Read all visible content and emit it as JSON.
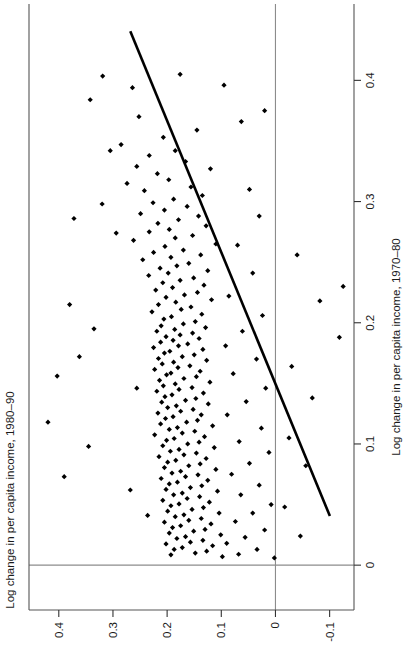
{
  "figure": {
    "background_color": "#ffffff",
    "orientation": "rotated-90-ccw",
    "marker_color": "#000000",
    "fit_line_color": "#000000",
    "reference_line_color": "#8c8c8c",
    "frame_color": "#555555"
  },
  "chart_data": {
    "type": "scatter",
    "title": "",
    "xlabel": "Log change in per capita income, 1970–80",
    "ylabel": "Log change in per capita income, 1980–90",
    "xlim": [
      -0.037,
      0.463
    ],
    "ylim": [
      -0.145,
      0.455
    ],
    "xticks": [
      0,
      0.1,
      0.2,
      0.3,
      0.4
    ],
    "xticklabels": [
      "0",
      "0.1",
      "0.2",
      "0.3",
      "0.4"
    ],
    "yticks": [
      -0.1,
      0,
      0.1,
      0.2,
      0.3,
      0.4
    ],
    "yticklabels": [
      "-0.1",
      "0",
      "0.1",
      "0.2",
      "0.3",
      "0.4"
    ],
    "grid": false,
    "legend": null,
    "reference_lines": [
      {
        "axis": "x",
        "value": 0
      },
      {
        "axis": "y",
        "value": 0
      }
    ],
    "fit_line": {
      "kind": "linear-regression",
      "x_start": 0.0405,
      "y_start": -0.1005,
      "x_end": 0.4405,
      "y_end": 0.268
    },
    "n_points": 251,
    "points": [
      [
        0.4035,
        0.319
      ],
      [
        0.394,
        0.264
      ],
      [
        0.37,
        0.252
      ],
      [
        0.359,
        0.145
      ],
      [
        0.353,
        0.207
      ],
      [
        0.347,
        0.285
      ],
      [
        0.342,
        0.185
      ],
      [
        0.338,
        0.233
      ],
      [
        0.333,
        0.166
      ],
      [
        0.329,
        0.256
      ],
      [
        0.327,
        0.12
      ],
      [
        0.323,
        0.218
      ],
      [
        0.318,
        0.197
      ],
      [
        0.315,
        0.274
      ],
      [
        0.312,
        0.156
      ],
      [
        0.309,
        0.242
      ],
      [
        0.305,
        0.135
      ],
      [
        0.302,
        0.188
      ],
      [
        0.299,
        0.226
      ],
      [
        0.296,
        0.163
      ],
      [
        0.293,
        0.205
      ],
      [
        0.29,
        0.249
      ],
      [
        0.288,
        0.142
      ],
      [
        0.285,
        0.179
      ],
      [
        0.282,
        0.217
      ],
      [
        0.28,
        0.128
      ],
      [
        0.277,
        0.196
      ],
      [
        0.275,
        0.233
      ],
      [
        0.272,
        0.153
      ],
      [
        0.27,
        0.185
      ],
      [
        0.268,
        0.262
      ],
      [
        0.265,
        0.11
      ],
      [
        0.263,
        0.204
      ],
      [
        0.26,
        0.17
      ],
      [
        0.258,
        0.225
      ],
      [
        0.256,
        0.138
      ],
      [
        0.254,
        0.193
      ],
      [
        0.252,
        0.245
      ],
      [
        0.249,
        0.16
      ],
      [
        0.247,
        0.182
      ],
      [
        0.245,
        0.213
      ],
      [
        0.243,
        0.125
      ],
      [
        0.241,
        0.198
      ],
      [
        0.239,
        0.234
      ],
      [
        0.237,
        0.151
      ],
      [
        0.235,
        0.176
      ],
      [
        0.233,
        0.208
      ],
      [
        0.231,
        0.132
      ],
      [
        0.229,
        0.19
      ],
      [
        0.227,
        0.221
      ],
      [
        0.225,
        0.144
      ],
      [
        0.223,
        0.168
      ],
      [
        0.221,
        0.202
      ],
      [
        0.219,
        0.118
      ],
      [
        0.217,
        0.184
      ],
      [
        0.215,
        0.216
      ],
      [
        0.213,
        0.156
      ],
      [
        0.211,
        0.174
      ],
      [
        0.209,
        0.228
      ],
      [
        0.207,
        0.136
      ],
      [
        0.205,
        0.192
      ],
      [
        0.203,
        0.206
      ],
      [
        0.201,
        0.148
      ],
      [
        0.199,
        0.17
      ],
      [
        0.1975,
        0.211
      ],
      [
        0.196,
        0.129
      ],
      [
        0.1945,
        0.186
      ],
      [
        0.193,
        0.219
      ],
      [
        0.1915,
        0.153
      ],
      [
        0.19,
        0.176
      ],
      [
        0.1885,
        0.202
      ],
      [
        0.187,
        0.141
      ],
      [
        0.1855,
        0.189
      ],
      [
        0.184,
        0.212
      ],
      [
        0.1825,
        0.162
      ],
      [
        0.181,
        0.179
      ],
      [
        0.1795,
        0.225
      ],
      [
        0.178,
        0.134
      ],
      [
        0.1765,
        0.195
      ],
      [
        0.175,
        0.205
      ],
      [
        0.1735,
        0.15
      ],
      [
        0.172,
        0.172
      ],
      [
        0.1705,
        0.216
      ],
      [
        0.169,
        0.127
      ],
      [
        0.1675,
        0.188
      ],
      [
        0.166,
        0.209
      ],
      [
        0.1645,
        0.158
      ],
      [
        0.163,
        0.18
      ],
      [
        0.1615,
        0.223
      ],
      [
        0.16,
        0.139
      ],
      [
        0.1585,
        0.193
      ],
      [
        0.157,
        0.201
      ],
      [
        0.1555,
        0.146
      ],
      [
        0.154,
        0.169
      ],
      [
        0.1525,
        0.214
      ],
      [
        0.151,
        0.121
      ],
      [
        0.1495,
        0.185
      ],
      [
        0.148,
        0.207
      ],
      [
        0.1465,
        0.154
      ],
      [
        0.145,
        0.178
      ],
      [
        0.1435,
        0.219
      ],
      [
        0.142,
        0.133
      ],
      [
        0.1405,
        0.191
      ],
      [
        0.139,
        0.204
      ],
      [
        0.1375,
        0.147
      ],
      [
        0.136,
        0.166
      ],
      [
        0.1345,
        0.21
      ],
      [
        0.133,
        0.124
      ],
      [
        0.1315,
        0.183
      ],
      [
        0.13,
        0.199
      ],
      [
        0.1285,
        0.152
      ],
      [
        0.127,
        0.175
      ],
      [
        0.1255,
        0.217
      ],
      [
        0.124,
        0.137
      ],
      [
        0.1225,
        0.189
      ],
      [
        0.121,
        0.203
      ],
      [
        0.1195,
        0.144
      ],
      [
        0.118,
        0.164
      ],
      [
        0.1165,
        0.212
      ],
      [
        0.115,
        0.116
      ],
      [
        0.1135,
        0.181
      ],
      [
        0.112,
        0.196
      ],
      [
        0.1105,
        0.149
      ],
      [
        0.109,
        0.172
      ],
      [
        0.1075,
        0.223
      ],
      [
        0.106,
        0.131
      ],
      [
        0.1045,
        0.187
      ],
      [
        0.103,
        0.201
      ],
      [
        0.1015,
        0.141
      ],
      [
        0.1,
        0.162
      ],
      [
        0.0985,
        0.208
      ],
      [
        0.097,
        0.113
      ],
      [
        0.0955,
        0.178
      ],
      [
        0.094,
        0.194
      ],
      [
        0.0925,
        0.146
      ],
      [
        0.091,
        0.169
      ],
      [
        0.0895,
        0.215
      ],
      [
        0.088,
        0.128
      ],
      [
        0.0865,
        0.184
      ],
      [
        0.085,
        0.199
      ],
      [
        0.0835,
        0.139
      ],
      [
        0.082,
        0.16
      ],
      [
        0.0805,
        0.205
      ],
      [
        0.079,
        0.11
      ],
      [
        0.0775,
        0.175
      ],
      [
        0.076,
        0.191
      ],
      [
        0.0745,
        0.143
      ],
      [
        0.073,
        0.166
      ],
      [
        0.0715,
        0.211
      ],
      [
        0.07,
        0.125
      ],
      [
        0.0685,
        0.181
      ],
      [
        0.067,
        0.196
      ],
      [
        0.0655,
        0.136
      ],
      [
        0.064,
        0.157
      ],
      [
        0.0625,
        0.202
      ],
      [
        0.061,
        0.107
      ],
      [
        0.0595,
        0.172
      ],
      [
        0.058,
        0.188
      ],
      [
        0.0565,
        0.14
      ],
      [
        0.055,
        0.163
      ],
      [
        0.0535,
        0.208
      ],
      [
        0.052,
        0.122
      ],
      [
        0.0505,
        0.178
      ],
      [
        0.049,
        0.193
      ],
      [
        0.0475,
        0.133
      ],
      [
        0.046,
        0.154
      ],
      [
        0.0445,
        0.199
      ],
      [
        0.043,
        0.104
      ],
      [
        0.0415,
        0.169
      ],
      [
        0.04,
        0.185
      ],
      [
        0.0385,
        0.137
      ],
      [
        0.037,
        0.16
      ],
      [
        0.0355,
        0.205
      ],
      [
        0.034,
        0.119
      ],
      [
        0.0325,
        0.175
      ],
      [
        0.031,
        0.19
      ],
      [
        0.0295,
        0.13
      ],
      [
        0.028,
        0.151
      ],
      [
        0.0265,
        0.196
      ],
      [
        0.025,
        0.101
      ],
      [
        0.0235,
        0.166
      ],
      [
        0.022,
        0.182
      ],
      [
        0.0205,
        0.134
      ],
      [
        0.019,
        0.157
      ],
      [
        0.0175,
        0.202
      ],
      [
        0.016,
        0.116
      ],
      [
        0.0145,
        0.172
      ],
      [
        0.013,
        0.187
      ],
      [
        0.0115,
        0.127
      ],
      [
        0.01,
        0.148
      ],
      [
        0.0085,
        0.193
      ],
      [
        0.007,
        0.098
      ],
      [
        0.366,
        0.063
      ],
      [
        0.31,
        0.048
      ],
      [
        0.288,
        0.03
      ],
      [
        0.264,
        0.07
      ],
      [
        0.241,
        0.042
      ],
      [
        0.222,
        0.086
      ],
      [
        0.206,
        0.024
      ],
      [
        0.193,
        0.061
      ],
      [
        0.181,
        0.092
      ],
      [
        0.17,
        0.035
      ],
      [
        0.158,
        0.078
      ],
      [
        0.146,
        0.018
      ],
      [
        0.135,
        0.054
      ],
      [
        0.124,
        0.089
      ],
      [
        0.113,
        0.026
      ],
      [
        0.102,
        0.067
      ],
      [
        0.093,
        0.012
      ],
      [
        0.084,
        0.048
      ],
      [
        0.075,
        0.081
      ],
      [
        0.066,
        0.03
      ],
      [
        0.058,
        0.064
      ],
      [
        0.05,
        0.008
      ],
      [
        0.043,
        0.042
      ],
      [
        0.036,
        0.074
      ],
      [
        0.029,
        0.02
      ],
      [
        0.023,
        0.056
      ],
      [
        0.018,
        0.09
      ],
      [
        0.013,
        0.034
      ],
      [
        0.009,
        0.068
      ],
      [
        0.006,
        0.002
      ],
      [
        0.298,
        0.32
      ],
      [
        0.215,
        0.38
      ],
      [
        0.156,
        0.403
      ],
      [
        0.118,
        0.42
      ],
      [
        0.098,
        0.345
      ],
      [
        0.073,
        0.39
      ],
      [
        0.256,
        -0.04
      ],
      [
        0.218,
        -0.082
      ],
      [
        0.188,
        -0.118
      ],
      [
        0.164,
        -0.03
      ],
      [
        0.138,
        -0.068
      ],
      [
        0.105,
        -0.025
      ],
      [
        0.082,
        -0.056
      ],
      [
        0.048,
        -0.017
      ],
      [
        0.024,
        -0.046
      ],
      [
        0.384,
        0.342
      ],
      [
        0.396,
        0.095
      ],
      [
        0.342,
        0.305
      ],
      [
        0.274,
        0.294
      ],
      [
        0.195,
        0.335
      ],
      [
        0.405,
        0.176
      ],
      [
        0.375,
        0.02
      ],
      [
        0.23,
        -0.125
      ],
      [
        0.172,
        0.362
      ],
      [
        0.041,
        0.236
      ],
      [
        0.062,
        0.268
      ],
      [
        0.146,
        0.256
      ],
      [
        0.286,
        0.372
      ]
    ]
  }
}
